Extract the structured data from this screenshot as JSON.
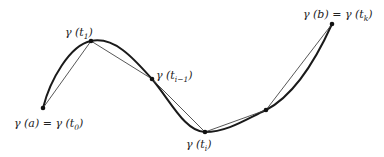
{
  "diagram": {
    "points": [
      {
        "id": "p0",
        "x": 43,
        "y": 108,
        "label": "γ (a) = γ (t",
        "sub": "0",
        "close": ")"
      },
      {
        "id": "p1",
        "x": 91,
        "y": 41,
        "label": "γ (t",
        "sub": "1",
        "close": ")"
      },
      {
        "id": "p2",
        "x": 152,
        "y": 79,
        "label": "γ (t",
        "sub": "i−1",
        "close": ")"
      },
      {
        "id": "p3",
        "x": 205,
        "y": 132,
        "label": "γ (t",
        "sub": "i",
        "close": ")"
      },
      {
        "id": "p4",
        "x": 266,
        "y": 110,
        "label": "",
        "sub": "",
        "close": ""
      },
      {
        "id": "p5",
        "x": 332,
        "y": 24,
        "label": "γ (b) = γ (t",
        "sub": "k",
        "close": ")"
      }
    ],
    "colors": {
      "curve": "#1a1a1a",
      "chord": "#444444",
      "point": "#111111"
    }
  }
}
